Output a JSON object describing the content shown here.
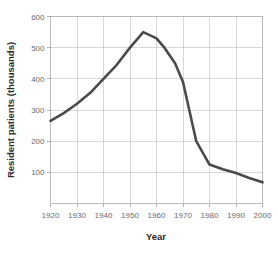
{
  "chart_data": {
    "type": "line",
    "title": "",
    "xlabel": "Year",
    "ylabel": "Resident patients (thousands)",
    "xlim": [
      1920,
      2000
    ],
    "ylim": [
      0,
      600
    ],
    "xticks": [
      1920,
      1930,
      1940,
      1950,
      1960,
      1970,
      1980,
      1990,
      2000
    ],
    "yticks": [
      100,
      200,
      300,
      400,
      500,
      600
    ],
    "xtick_labels": [
      "1920",
      "1930",
      "1940",
      "1950",
      "1960",
      "1970",
      "1980",
      "1990",
      "2000"
    ],
    "ytick_labels": [
      "100",
      "200",
      "300",
      "400",
      "500",
      "600"
    ],
    "grid": true,
    "grid_axes": "both",
    "legend": false,
    "legend_position": "none",
    "line_color": "#4a4a4a",
    "line_width": 2.6,
    "series": [
      {
        "name": "Resident patients",
        "x": [
          1920,
          1925,
          1930,
          1935,
          1940,
          1945,
          1950,
          1955,
          1960,
          1963,
          1967,
          1970,
          1975,
          1980,
          1985,
          1990,
          1995,
          2000
        ],
        "values": [
          265,
          290,
          320,
          355,
          400,
          445,
          500,
          550,
          530,
          500,
          450,
          390,
          200,
          125,
          110,
          98,
          82,
          68
        ]
      }
    ],
    "annotations": []
  },
  "axes": {
    "y_axis_title": "Resident patients (thousands)",
    "x_axis_title": "Year"
  },
  "colors": {
    "line": "#4a4a4a",
    "grid": "#c8c8c8",
    "frame": "#b4b4b4",
    "tick_text": "#6a6a6a",
    "title_text": "#2b2b2b",
    "background": "#ffffff"
  }
}
